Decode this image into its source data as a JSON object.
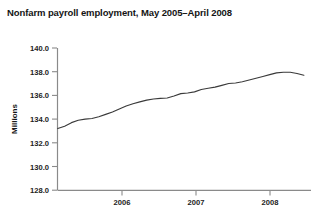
{
  "chart_data": {
    "type": "line",
    "title": "Nonfarm payroll employment, May 2005–April 2008",
    "xlabel": "",
    "ylabel": "Millions",
    "ylim": [
      128.0,
      140.0
    ],
    "ytick_labels": [
      "140.0",
      "138.0",
      "136.0",
      "134.0",
      "132.0",
      "130.0",
      "128.0"
    ],
    "ytick_values": [
      140.0,
      138.0,
      136.0,
      134.0,
      132.0,
      130.0,
      128.0
    ],
    "xtick_labels": [
      "2006",
      "2007",
      "2008"
    ],
    "xtick_values": [
      2006.0,
      2007.0,
      2008.0
    ],
    "xlim": [
      2005.33,
      2008.42
    ],
    "grid": false,
    "legend": "none",
    "series": [
      {
        "name": "Nonfarm payroll employment",
        "units": "millions",
        "x": [
          2005.333,
          2005.417,
          2005.5,
          2005.583,
          2005.667,
          2005.75,
          2005.833,
          2005.917,
          2006.0,
          2006.083,
          2006.167,
          2006.25,
          2006.333,
          2006.417,
          2006.5,
          2006.583,
          2006.667,
          2006.75,
          2006.833,
          2006.917,
          2007.0,
          2007.083,
          2007.167,
          2007.25,
          2007.333,
          2007.417,
          2007.5,
          2007.583,
          2007.667,
          2007.75,
          2007.833,
          2007.917,
          2008.0,
          2008.083,
          2008.167,
          2008.25,
          2008.333
        ],
        "x_labels": [
          "May 2005",
          "Jun 2005",
          "Jul 2005",
          "Aug 2005",
          "Sep 2005",
          "Oct 2005",
          "Nov 2005",
          "Dec 2005",
          "Jan 2006",
          "Feb 2006",
          "Mar 2006",
          "Apr 2006",
          "May 2006",
          "Jun 2006",
          "Jul 2006",
          "Aug 2006",
          "Sep 2006",
          "Oct 2006",
          "Nov 2006",
          "Dec 2006",
          "Jan 2007",
          "Feb 2007",
          "Mar 2007",
          "Apr 2007",
          "May 2007",
          "Jun 2007",
          "Jul 2007",
          "Aug 2007",
          "Sep 2007",
          "Oct 2007",
          "Nov 2007",
          "Dec 2007",
          "Jan 2008",
          "Feb 2008",
          "Mar 2008",
          "Apr 2008"
        ],
        "values": [
          133.2,
          133.4,
          133.7,
          133.9,
          134.0,
          134.05,
          134.2,
          134.4,
          134.6,
          134.85,
          135.1,
          135.3,
          135.45,
          135.6,
          135.7,
          135.75,
          135.78,
          135.95,
          136.15,
          136.2,
          136.3,
          136.5,
          136.6,
          136.7,
          136.85,
          137.0,
          137.05,
          137.15,
          137.3,
          137.45,
          137.6,
          137.75,
          137.9,
          137.95,
          137.95,
          137.85,
          137.7
        ]
      }
    ]
  }
}
